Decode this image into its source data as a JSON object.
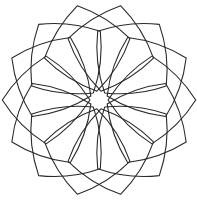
{
  "figure": {
    "background": "#ffffff",
    "stroke_color": "#2a2a2a",
    "center": [
      99,
      100
    ],
    "copies": 14,
    "square_size": 62,
    "offset": 8,
    "arc_bulge": 7,
    "star_points": 7
  }
}
